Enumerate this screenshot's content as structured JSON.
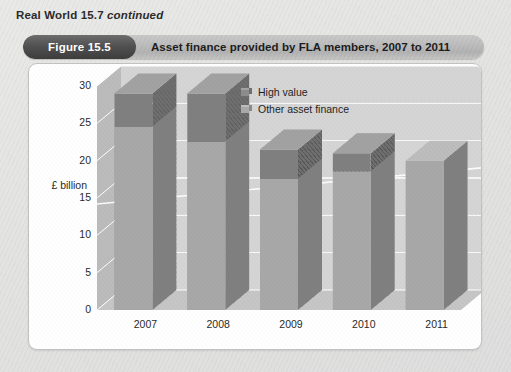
{
  "header": {
    "series_label": "Real World 15.7",
    "continued_label": "continued"
  },
  "figure": {
    "badge": "Figure 15.5",
    "title": "Asset finance provided by FLA members, 2007 to 2011"
  },
  "colors": {
    "high_value": "#8c8c8c",
    "high_value_side": "#6f6f6f",
    "high_value_top": "#a2a2a2",
    "other_asset": "#a8a8a8",
    "other_asset_side": "#8a8a8a",
    "other_asset_top": "#bdbdbd",
    "plot_back_wall": "#d5d5d5",
    "plot_side_wall": "#bcbcbc",
    "plot_floor": "#c6c6c6",
    "gridline": "#ffffff",
    "badge_bg": "#4a4a4a",
    "title_bar_bg": "#bdbdbd",
    "card_bg": "#ffffff",
    "page_bg": "#e6e6e4"
  },
  "chart_data": {
    "type": "bar",
    "subtype": "stacked-3d-column",
    "title": "Asset finance provided by FLA members, 2007 to 2011",
    "xlabel": "",
    "ylabel": "£ billion",
    "ylim": [
      0,
      30
    ],
    "yticks": [
      0,
      5,
      10,
      15,
      20,
      25,
      30
    ],
    "ytick_labels": [
      "0",
      "5",
      "10",
      "15",
      "20",
      "25",
      "30"
    ],
    "categories": [
      "2007",
      "2008",
      "2009",
      "2010",
      "2011"
    ],
    "grid": true,
    "legend_position": "top-right",
    "series": [
      {
        "name": "Other asset finance",
        "values": [
          24.5,
          22.5,
          17.5,
          18.5,
          20.0
        ]
      },
      {
        "name": "High value",
        "values": [
          4.5,
          6.5,
          4.0,
          2.5,
          0.0
        ]
      }
    ],
    "totals": [
      29.0,
      29.0,
      21.5,
      21.0,
      20.0
    ],
    "stack_order_bottom_to_top": [
      "Other asset finance",
      "High value"
    ]
  },
  "legend": {
    "items": [
      {
        "label": "High value",
        "key": "high_value"
      },
      {
        "label": "Other asset finance",
        "key": "other_asset"
      }
    ]
  }
}
